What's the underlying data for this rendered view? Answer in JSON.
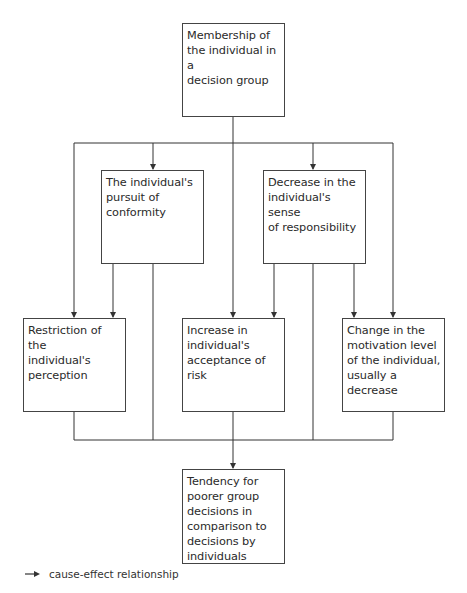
{
  "diagram": {
    "nodes": [
      {
        "id": "membership",
        "label": "Membership of\nthe individual in a\ndecision group",
        "x": 182,
        "y": 23,
        "w": 103,
        "h": 94
      },
      {
        "id": "conformity",
        "label": "The individual's\npursuit of\nconformity",
        "x": 101,
        "y": 170,
        "w": 103,
        "h": 94
      },
      {
        "id": "responsibility",
        "label": "Decrease in the\nindividual's sense\nof responsibility",
        "x": 263,
        "y": 170,
        "w": 103,
        "h": 94
      },
      {
        "id": "perception",
        "label": "Restriction of the\nindividual's\nperception",
        "x": 23,
        "y": 318,
        "w": 103,
        "h": 94
      },
      {
        "id": "risk",
        "label": "Increase in\nindividual's\nacceptance of risk",
        "x": 182,
        "y": 318,
        "w": 103,
        "h": 94
      },
      {
        "id": "motivation",
        "label": "Change in the\nmotivation level\nof the individual,\nusually a decrease",
        "x": 342,
        "y": 318,
        "w": 103,
        "h": 94
      },
      {
        "id": "outcome",
        "label": "Tendency for\npoorer group\ndecisions in\ncomparison to\ndecisions by\nindividuals",
        "x": 182,
        "y": 469,
        "w": 103,
        "h": 95
      }
    ],
    "edges": [
      {
        "from": "membership",
        "to": "conformity"
      },
      {
        "from": "membership",
        "to": "responsibility"
      },
      {
        "from": "membership",
        "to": "perception"
      },
      {
        "from": "membership",
        "to": "risk"
      },
      {
        "from": "membership",
        "to": "motivation"
      },
      {
        "from": "conformity",
        "to": "perception"
      },
      {
        "from": "conformity",
        "to": "outcome"
      },
      {
        "from": "responsibility",
        "to": "risk"
      },
      {
        "from": "responsibility",
        "to": "motivation"
      },
      {
        "from": "responsibility",
        "to": "outcome"
      },
      {
        "from": "perception",
        "to": "outcome"
      },
      {
        "from": "risk",
        "to": "outcome"
      },
      {
        "from": "motivation",
        "to": "outcome"
      }
    ]
  },
  "legend": {
    "arrow_label": "cause-effect relationship"
  },
  "colors": {
    "line": "#333333",
    "border": "#444444",
    "text": "#2a2a2a"
  }
}
